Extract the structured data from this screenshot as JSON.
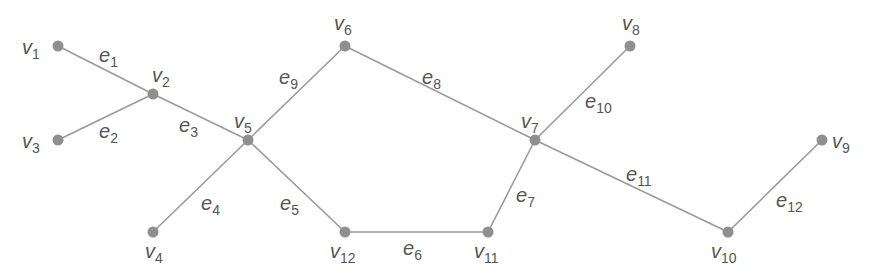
{
  "diagram": {
    "type": "graph",
    "colors": {
      "edge": "#9a9a9a",
      "node": "#8f8f8f",
      "label": "#555555",
      "background": "#ffffff"
    },
    "vertices": [
      {
        "id": "v1",
        "base": "v",
        "sub": "1"
      },
      {
        "id": "v2",
        "base": "v",
        "sub": "2"
      },
      {
        "id": "v3",
        "base": "v",
        "sub": "3"
      },
      {
        "id": "v4",
        "base": "v",
        "sub": "4"
      },
      {
        "id": "v5",
        "base": "v",
        "sub": "5"
      },
      {
        "id": "v6",
        "base": "v",
        "sub": "6"
      },
      {
        "id": "v7",
        "base": "v",
        "sub": "7"
      },
      {
        "id": "v8",
        "base": "v",
        "sub": "8"
      },
      {
        "id": "v9",
        "base": "v",
        "sub": "9"
      },
      {
        "id": "v10",
        "base": "v",
        "sub": "10"
      },
      {
        "id": "v11",
        "base": "v",
        "sub": "11"
      },
      {
        "id": "v12",
        "base": "v",
        "sub": "12"
      }
    ],
    "edges": [
      {
        "id": "e1",
        "base": "e",
        "sub": "1",
        "from": "v1",
        "to": "v2"
      },
      {
        "id": "e2",
        "base": "e",
        "sub": "2",
        "from": "v3",
        "to": "v2"
      },
      {
        "id": "e3",
        "base": "e",
        "sub": "3",
        "from": "v2",
        "to": "v5"
      },
      {
        "id": "e4",
        "base": "e",
        "sub": "4",
        "from": "v4",
        "to": "v5"
      },
      {
        "id": "e5",
        "base": "e",
        "sub": "5",
        "from": "v5",
        "to": "v12"
      },
      {
        "id": "e6",
        "base": "e",
        "sub": "6",
        "from": "v12",
        "to": "v11"
      },
      {
        "id": "e7",
        "base": "e",
        "sub": "7",
        "from": "v11",
        "to": "v7"
      },
      {
        "id": "e8",
        "base": "e",
        "sub": "8",
        "from": "v6",
        "to": "v7"
      },
      {
        "id": "e9",
        "base": "e",
        "sub": "9",
        "from": "v5",
        "to": "v6"
      },
      {
        "id": "e10",
        "base": "e",
        "sub": "10",
        "from": "v7",
        "to": "v8"
      },
      {
        "id": "e11",
        "base": "e",
        "sub": "11",
        "from": "v7",
        "to": "v10"
      },
      {
        "id": "e12",
        "base": "e",
        "sub": "12",
        "from": "v10",
        "to": "v9"
      }
    ]
  }
}
